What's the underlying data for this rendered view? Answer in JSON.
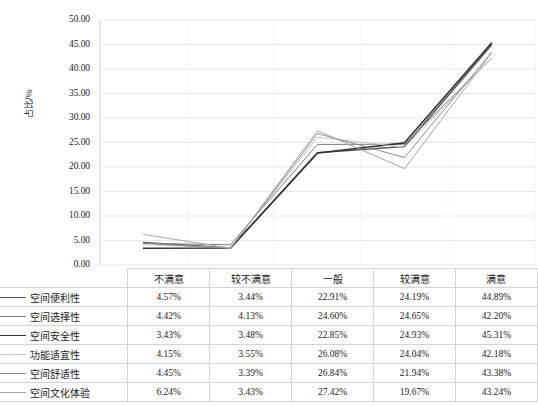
{
  "chart_data": {
    "type": "line",
    "title": "",
    "xlabel": "",
    "ylabel": "占比/%",
    "ylim": [
      0,
      50
    ],
    "ytick_step": 5,
    "ytick_labels": [
      "50.00",
      "45.00",
      "40.00",
      "35.00",
      "30.00",
      "25.00",
      "20.00",
      "15.00",
      "10.00",
      "5.00",
      "0.00"
    ],
    "grid": true,
    "legend_position": "table-below",
    "categories": [
      "不满意",
      "较不满意",
      "一般",
      "较满意",
      "满意"
    ],
    "series": [
      {
        "name": "空间便利性",
        "color": "#595959",
        "width": 1.6,
        "values": [
          4.57,
          3.44,
          22.91,
          24.19,
          44.89
        ],
        "labels": [
          "4.57%",
          "3.44%",
          "22.91%",
          "24.19%",
          "44.89%"
        ]
      },
      {
        "name": "空间选择性",
        "color": "#808080",
        "width": 1.0,
        "values": [
          4.42,
          4.13,
          24.6,
          24.65,
          42.2
        ],
        "labels": [
          "4.42%",
          "4.13%",
          "24.60%",
          "24.65%",
          "42.20%"
        ]
      },
      {
        "name": "空间安全性",
        "color": "#333333",
        "width": 1.6,
        "values": [
          3.43,
          3.48,
          22.85,
          24.93,
          45.31
        ],
        "labels": [
          "3.43%",
          "3.48%",
          "22.85%",
          "24.93%",
          "45.31%"
        ]
      },
      {
        "name": "功能适宜性",
        "color": "#c4c4c4",
        "width": 1.0,
        "values": [
          4.15,
          3.55,
          26.08,
          24.04,
          42.18
        ],
        "labels": [
          "4.15%",
          "3.55%",
          "26.08%",
          "24.04%",
          "42.18%"
        ]
      },
      {
        "name": "空间舒适性",
        "color": "#8c8c8c",
        "width": 1.0,
        "values": [
          4.45,
          3.39,
          26.84,
          21.94,
          43.38
        ],
        "labels": [
          "4.45%",
          "3.39%",
          "26.84%",
          "21.94%",
          "43.38%"
        ]
      },
      {
        "name": "空间文化体验",
        "color": "#a6a6a6",
        "width": 1.0,
        "values": [
          6.24,
          3.43,
          27.42,
          19.67,
          43.24
        ],
        "labels": [
          "6.24%",
          "3.43%",
          "27.42%",
          "19.67%",
          "43.24%"
        ]
      }
    ]
  },
  "table": {
    "header_blank": "",
    "headers": [
      "不满意",
      "较不满意",
      "一般",
      "较满意",
      "满意"
    ],
    "rows": [
      {
        "label": "空间便利性",
        "values": [
          "4.57%",
          "3.44%",
          "22.91%",
          "24.19%",
          "44.89%"
        ]
      },
      {
        "label": "空间选择性",
        "values": [
          "4.42%",
          "4.13%",
          "24.60%",
          "24.65%",
          "42.20%"
        ]
      },
      {
        "label": "空间安全性",
        "values": [
          "3.43%",
          "3.48%",
          "22.85%",
          "24.93%",
          "45.31%"
        ]
      },
      {
        "label": "功能适宜性",
        "values": [
          "4.15%",
          "3.55%",
          "26.08%",
          "24.04%",
          "42.18%"
        ]
      },
      {
        "label": "空间舒适性",
        "values": [
          "4.45%",
          "3.39%",
          "26.84%",
          "21.94%",
          "43.38%"
        ]
      },
      {
        "label": "空间文化体验",
        "values": [
          "6.24%",
          "3.43%",
          "27.42%",
          "19.67%",
          "43.24%"
        ]
      }
    ]
  },
  "colors": {
    "gridline": "#e8e8e8",
    "table_border": "#d4d4d4",
    "text": "#1a1a1a",
    "background": "#ffffff"
  }
}
